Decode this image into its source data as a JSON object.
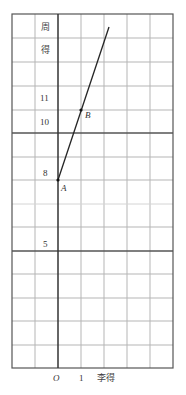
{
  "figure": {
    "type": "coordinate-grid-diagram",
    "x_axis": {
      "label": "李得",
      "origin_label": "O",
      "tick_labels": [
        "1"
      ]
    },
    "y_axis": {
      "label_chars": [
        "周",
        "得"
      ],
      "tick_labels": [
        "11",
        "10",
        "8",
        "5"
      ]
    },
    "points": [
      {
        "name": "A",
        "x": 0,
        "y": 8
      },
      {
        "name": "B",
        "x": 1,
        "y": 11
      }
    ],
    "line": {
      "description": "Line through A and B",
      "slope": 3,
      "intercept": 8
    },
    "grid": {
      "columns": 7,
      "rows": 15
    }
  },
  "labels": {
    "y_char_1": "周",
    "y_char_2": "得",
    "y_11": "11",
    "y_10": "10",
    "y_8": "8",
    "y_5": "5",
    "point_a": "A",
    "point_b": "B",
    "origin": "O",
    "x_1": "1",
    "x_axis_label": "李得"
  },
  "colors": {
    "grid": "#b5b5b5",
    "axis": "#333333",
    "line": "#222222"
  }
}
